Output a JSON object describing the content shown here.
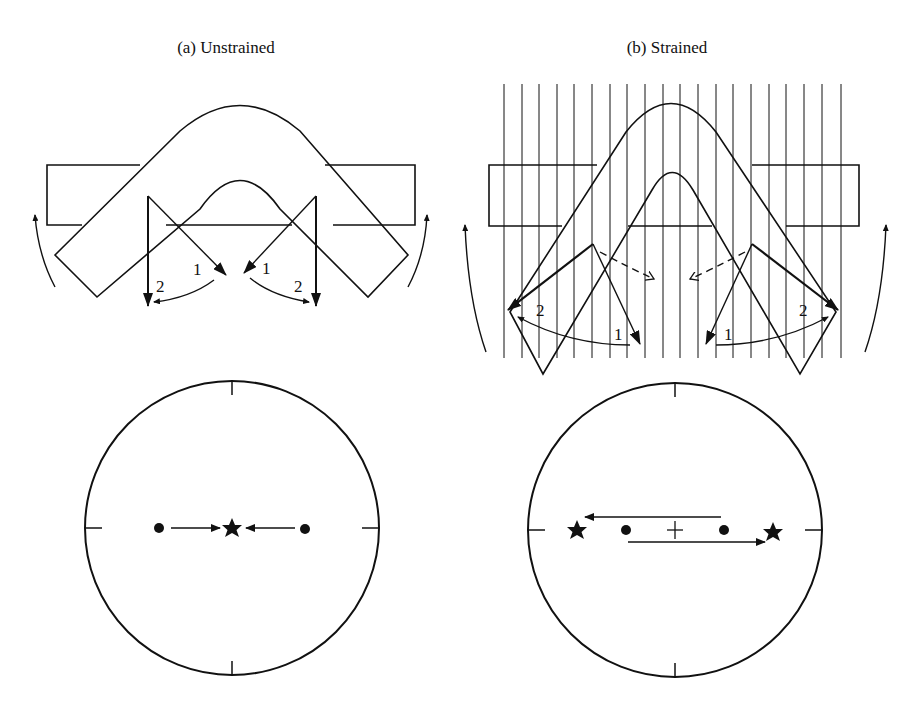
{
  "figure": {
    "panels": [
      {
        "id": "a",
        "title": "(a) Unstrained",
        "labels": {
          "inner": "1",
          "outer": "2"
        },
        "projection": {
          "points": [
            "left-dot",
            "right-dot"
          ],
          "result": "center-star",
          "description": "Both points move toward the center, meeting at a single star"
        }
      },
      {
        "id": "b",
        "title": "(b) Strained",
        "labels": {
          "inner": "1",
          "outer": "2"
        },
        "projection": {
          "points": [
            "left-dot",
            "right-dot"
          ],
          "result": "two-stars",
          "center_marker": "+",
          "description": "Points move apart in opposite directions to stars near the primitive circle"
        }
      }
    ],
    "colors": {
      "ink": "#111111",
      "background": "#ffffff"
    }
  }
}
